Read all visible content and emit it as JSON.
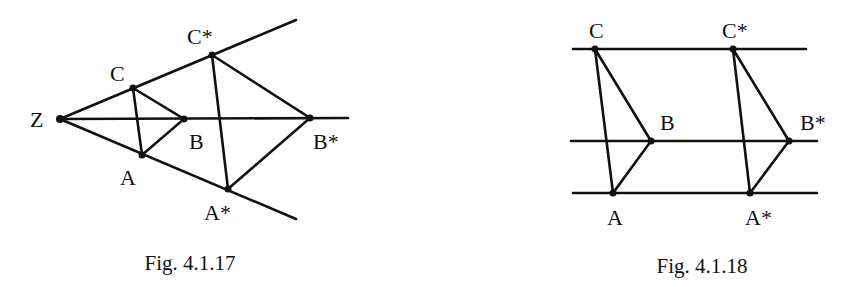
{
  "figures": [
    {
      "caption": "Fig. 4.1.17",
      "description": "Central dilation with center Z mapping triangle ABC to A*B*C*",
      "points": {
        "Z": {
          "label": "Z",
          "x": 60,
          "y": 119
        },
        "C": {
          "label": "C",
          "x": 133,
          "y": 88
        },
        "B": {
          "label": "B",
          "x": 184,
          "y": 119
        },
        "A": {
          "label": "A",
          "x": 142,
          "y": 155
        },
        "C_star": {
          "label": "C*",
          "x": 212,
          "y": 55
        },
        "B_star": {
          "label": "B*",
          "x": 310,
          "y": 118
        },
        "A_star": {
          "label": "A*",
          "x": 228,
          "y": 189
        }
      }
    },
    {
      "caption": "Fig. 4.1.18",
      "description": "Parallel translation of triangle ABC to A*B*C* along three parallel lines",
      "points": {
        "C": {
          "label": "C",
          "x": 595,
          "y": 49
        },
        "B": {
          "label": "B",
          "x": 651,
          "y": 141
        },
        "A": {
          "label": "A",
          "x": 613,
          "y": 193
        },
        "C_star": {
          "label": "C*",
          "x": 733,
          "y": 49
        },
        "B_star": {
          "label": "B*",
          "x": 789,
          "y": 141
        },
        "A_star": {
          "label": "A*",
          "x": 750,
          "y": 193
        }
      }
    }
  ]
}
